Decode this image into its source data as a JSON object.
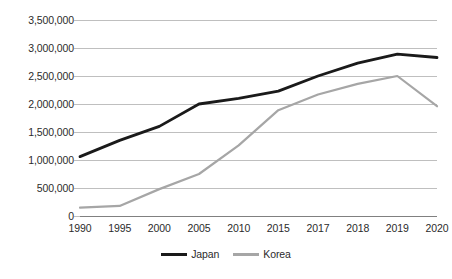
{
  "chart_data": {
    "type": "line",
    "title": "",
    "xlabel": "",
    "ylabel": "",
    "categories": [
      "1990",
      "1995",
      "2000",
      "2005",
      "2010",
      "2015",
      "2017",
      "2018",
      "2019",
      "2020"
    ],
    "series": [
      {
        "name": "Japan",
        "color": "#1a1a1a",
        "values": [
          1060000,
          1350000,
          1600000,
          2000000,
          2100000,
          2230000,
          2500000,
          2730000,
          2890000,
          2830000
        ]
      },
      {
        "name": "Korea",
        "color": "#a6a6a6",
        "values": [
          150000,
          180000,
          480000,
          750000,
          1260000,
          1890000,
          2170000,
          2360000,
          2500000,
          1960000
        ]
      }
    ],
    "ylim": [
      0,
      3500000
    ],
    "ytick_values": [
      3500000,
      3000000,
      2500000,
      2000000,
      1500000,
      1000000,
      500000,
      0
    ],
    "ytick_labels": [
      "3,500,000",
      "3,000,000",
      "2,500,000",
      "2,000,000",
      "1,500,000",
      "1,000,000",
      "500,000",
      "0"
    ],
    "grid": true,
    "legend_position": "bottom",
    "legend_entries": [
      "Japan",
      "Korea"
    ]
  },
  "legend": {
    "items": [
      {
        "label": "Japan",
        "color": "#1a1a1a"
      },
      {
        "label": "Korea",
        "color": "#a6a6a6"
      }
    ]
  },
  "colors": {
    "japan_line": "#1a1a1a",
    "korea_line": "#a6a6a6",
    "gridline": "#bfbfbf",
    "axis": "#808080",
    "text": "#2b2b2b",
    "background": "#ffffff"
  }
}
